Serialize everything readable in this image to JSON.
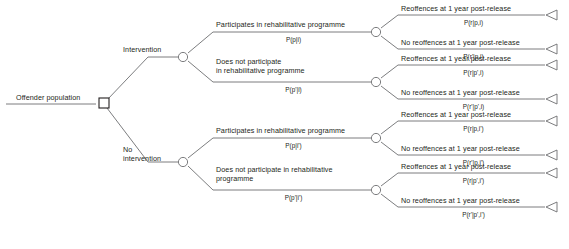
{
  "diagram": {
    "type": "decision-tree",
    "root_label": "Offender population",
    "node_shapes": {
      "decision": "square",
      "chance": "circle",
      "terminal": "triangle"
    },
    "branches": [
      {
        "label": "Intervention",
        "children": [
          {
            "label": "Participates in rehabilitative programme",
            "probability": "P(p|i)",
            "children": [
              {
                "label": "Reoffences at 1 year post-release",
                "probability": "P(r|p,i)"
              },
              {
                "label": "No reoffences at 1 year post-release",
                "probability": "P(r'|p,i)"
              }
            ]
          },
          {
            "label": "Does not participate in rehabilitative programme",
            "probability": "P(p'|i)",
            "children": [
              {
                "label": "Reoffences at 1 year post-release",
                "probability": "P(r|p',i)"
              },
              {
                "label": "No reoffences at 1 year post-release",
                "probability": "P(r'|p',i)"
              }
            ]
          }
        ]
      },
      {
        "label": "No intervention",
        "children": [
          {
            "label": "Participates in rehabilitative programme",
            "probability": "P(p|i')",
            "children": [
              {
                "label": "Reoffences at 1 year post-release",
                "probability": "P(r|p,i')"
              },
              {
                "label": "No reoffences at 1 year post-release",
                "probability": "P(r'|p,i')"
              }
            ]
          },
          {
            "label": "Does not participate in rehabilitative programme",
            "probability": "P(p'|i')",
            "children": [
              {
                "label": "Reoffences at 1 year post-release",
                "probability": "P(r|p',i')"
              },
              {
                "label": "No reoffences at 1 year post-release",
                "probability": "P(r'|p',i')"
              }
            ]
          }
        ]
      }
    ],
    "text": {
      "branch1_label": "Intervention",
      "branch2_label_line1": "No",
      "branch2_label_line2": "intervention",
      "b1c1_label": "Participates in rehabilitative programme",
      "b1c2_label_line1": "Does not participate",
      "b1c2_label_line2": "in rehabilitative programme",
      "b2c1_label": "Participates in rehabilitative programme",
      "b2c2_label_line1": "Does not participate in rehabilitative",
      "b2c2_label_line2": "programme",
      "reoffences": "Reoffences at 1 year post-release",
      "no_reoffences": "No reoffences at 1 year post-release"
    },
    "colors": {
      "line": "#6d6e71",
      "text": "#231f20",
      "node_stroke": "#231f20",
      "node_fill": "#ffffff"
    }
  }
}
